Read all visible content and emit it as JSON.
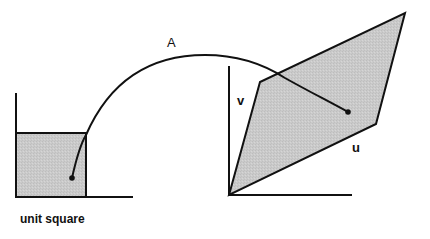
{
  "diagram": {
    "labels": {
      "map": "A",
      "vector_v": "v",
      "vector_u": "u",
      "unit_square": "unit square"
    },
    "colors": {
      "fill": "#c8c8c8",
      "stroke": "#111111",
      "background": "#ffffff"
    }
  }
}
